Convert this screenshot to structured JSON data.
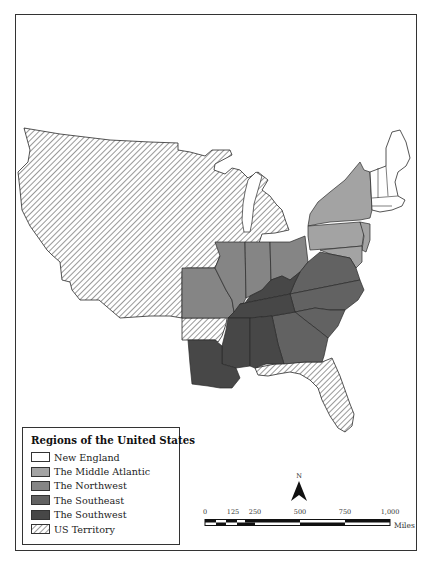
{
  "map": {
    "legend": {
      "title": "Regions of the United States",
      "items": [
        {
          "label": "New England",
          "color": "#ffffff",
          "pattern": "solid"
        },
        {
          "label": "The Middle Atlantic",
          "color": "#a3a3a3",
          "pattern": "solid"
        },
        {
          "label": "The Northwest",
          "color": "#858585",
          "pattern": "solid"
        },
        {
          "label": "The Southeast",
          "color": "#626262",
          "pattern": "solid"
        },
        {
          "label": "The Southwest",
          "color": "#474747",
          "pattern": "solid"
        },
        {
          "label": "US Territory",
          "color": "#ffffff",
          "pattern": "hatched"
        }
      ]
    },
    "north_arrow": {
      "label": "N"
    },
    "scale_bar": {
      "ticks": [
        "0",
        "125",
        "250",
        "500",
        "750",
        "1,000"
      ],
      "unit": "Miles"
    },
    "regions": {
      "new_england": "New England",
      "middle_atlantic": "The Middle Atlantic",
      "northwest": "The Northwest",
      "southeast": "The Southeast",
      "southwest": "The Southwest",
      "territory": "US Territory"
    },
    "colors": {
      "new_england": "#ffffff",
      "middle_atlantic": "#a3a3a3",
      "northwest": "#858585",
      "southeast": "#626262",
      "southwest": "#474747",
      "border": "#2a2a2a"
    }
  }
}
